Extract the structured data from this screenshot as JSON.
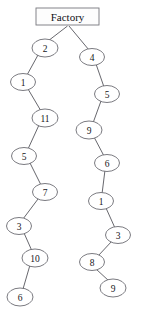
{
  "diagram": {
    "root": {
      "id": "factory",
      "label": "Factory",
      "shape": "rectangle",
      "x": 67.5,
      "y": 16.5,
      "width": 63,
      "height": 17
    },
    "node_shape": "ellipse",
    "node_rx": 12.5,
    "node_ry": 8.5,
    "colors": {
      "background": "#ffffff",
      "node_fill": "#ffffff",
      "node_stroke": "#6b6b72",
      "edge_stroke": "#56565c",
      "text": "#16161a",
      "root_stroke": "#77777d"
    },
    "nodes": [
      {
        "id": "L1",
        "label": "2",
        "x": 45,
        "y": 48,
        "rx": 13,
        "ry": 9
      },
      {
        "id": "L2",
        "label": "1",
        "x": 23,
        "y": 82,
        "rx": 12.5,
        "ry": 8.5
      },
      {
        "id": "L3",
        "label": "11",
        "x": 45,
        "y": 118,
        "rx": 13,
        "ry": 9
      },
      {
        "id": "L4",
        "label": "5",
        "x": 24,
        "y": 156,
        "rx": 12.5,
        "ry": 8.5
      },
      {
        "id": "L5",
        "label": "7",
        "x": 45,
        "y": 192,
        "rx": 12.5,
        "ry": 8.5
      },
      {
        "id": "L6",
        "label": "3",
        "x": 19,
        "y": 226,
        "rx": 12.5,
        "ry": 8.5
      },
      {
        "id": "L7",
        "label": "10",
        "x": 35,
        "y": 258,
        "rx": 13,
        "ry": 9
      },
      {
        "id": "L8",
        "label": "6",
        "x": 20,
        "y": 297,
        "rx": 13,
        "ry": 9
      },
      {
        "id": "R1",
        "label": "4",
        "x": 92,
        "y": 57,
        "rx": 12.5,
        "ry": 8.5
      },
      {
        "id": "R2",
        "label": "5",
        "x": 107,
        "y": 94,
        "rx": 12.5,
        "ry": 8.5
      },
      {
        "id": "R3",
        "label": "9",
        "x": 89,
        "y": 130,
        "rx": 13,
        "ry": 9
      },
      {
        "id": "R4",
        "label": "6",
        "x": 107,
        "y": 163,
        "rx": 12.5,
        "ry": 8.5
      },
      {
        "id": "R5",
        "label": "1",
        "x": 101,
        "y": 201,
        "rx": 12.5,
        "ry": 8.5
      },
      {
        "id": "R6",
        "label": "3",
        "x": 118,
        "y": 235,
        "rx": 12.5,
        "ry": 8.5
      },
      {
        "id": "R7",
        "label": "8",
        "x": 92,
        "y": 262,
        "rx": 12.5,
        "ry": 8.5
      },
      {
        "id": "R8",
        "label": "9",
        "x": 113,
        "y": 288,
        "rx": 13,
        "ry": 9
      }
    ],
    "edges": [
      {
        "from": "factory",
        "to": "L1",
        "x1": 67.5,
        "y1": 26,
        "x2": 48,
        "y2": 41
      },
      {
        "from": "factory",
        "to": "R1",
        "x1": 69,
        "y1": 26,
        "x2": 89,
        "y2": 50
      },
      {
        "from": "L1",
        "to": "L2",
        "x1": 38,
        "y1": 55,
        "x2": 27,
        "y2": 75
      },
      {
        "from": "L2",
        "to": "L3",
        "x1": 28,
        "y1": 89,
        "x2": 41,
        "y2": 111
      },
      {
        "from": "L3",
        "to": "L4",
        "x1": 39,
        "y1": 125,
        "x2": 28,
        "y2": 149
      },
      {
        "from": "L4",
        "to": "L5",
        "x1": 30,
        "y1": 163,
        "x2": 41,
        "y2": 185
      },
      {
        "from": "L5",
        "to": "L6",
        "x1": 38,
        "y1": 199,
        "x2": 23,
        "y2": 219
      },
      {
        "from": "L6",
        "to": "L7",
        "x1": 24,
        "y1": 233,
        "x2": 32,
        "y2": 251
      },
      {
        "from": "L7",
        "to": "L8",
        "x1": 30,
        "y1": 265,
        "x2": 23,
        "y2": 289
      },
      {
        "from": "R1",
        "to": "R2",
        "x1": 96,
        "y1": 64,
        "x2": 104,
        "y2": 87
      },
      {
        "from": "R2",
        "to": "R3",
        "x1": 101,
        "y1": 101,
        "x2": 93,
        "y2": 123
      },
      {
        "from": "R3",
        "to": "R4",
        "x1": 94,
        "y1": 137,
        "x2": 104,
        "y2": 156
      },
      {
        "from": "R4",
        "to": "R5",
        "x1": 105,
        "y1": 170,
        "x2": 102,
        "y2": 194
      },
      {
        "from": "R5",
        "to": "R6",
        "x1": 106,
        "y1": 208,
        "x2": 115,
        "y2": 228
      },
      {
        "from": "R6",
        "to": "R7",
        "x1": 112,
        "y1": 241,
        "x2": 98,
        "y2": 256
      },
      {
        "from": "R7",
        "to": "R8",
        "x1": 96,
        "y1": 269,
        "x2": 109,
        "y2": 281
      }
    ]
  }
}
